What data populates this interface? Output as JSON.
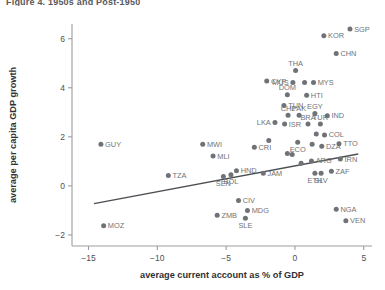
{
  "header": {
    "cropped_title": "Figure 4.  1950s and Post-1950"
  },
  "chart_data": {
    "type": "scatter",
    "title": "",
    "xlabel": "average current account as % of GDP",
    "ylabel": "average per capita GDP growth",
    "xlim": [
      -16.2,
      5.6
    ],
    "ylim": [
      -2.45,
      6.6
    ],
    "xticks": [
      -15,
      -10,
      -5,
      0,
      5
    ],
    "xticklabels": [
      "−15",
      "−10",
      "−5",
      "0",
      "5"
    ],
    "yticks": [
      -2,
      0,
      2,
      4,
      6
    ],
    "yticklabels": [
      "−2",
      "0",
      "2",
      "4",
      "6"
    ],
    "grid": false,
    "legend": "none",
    "marker_color": "#6f7276",
    "line_color": "#4b4e52",
    "trendline": {
      "label": "",
      "x": [
        -14.6,
        4.6
      ],
      "y": [
        -0.72,
        1.3
      ]
    },
    "points": [
      {
        "label": "SGP",
        "x": 4.0,
        "y": 6.4,
        "lp": "right"
      },
      {
        "label": "KOR",
        "x": 2.1,
        "y": 6.12,
        "lp": "right"
      },
      {
        "label": "CHN",
        "x": 3.0,
        "y": 5.4,
        "lp": "right"
      },
      {
        "label": "THA",
        "x": 0.05,
        "y": 4.7,
        "lp": "top"
      },
      {
        "label": "CYP",
        "x": -2.05,
        "y": 4.28,
        "lp": "right"
      },
      {
        "label": "MUS",
        "x": -0.15,
        "y": 4.22,
        "lp": "left"
      },
      {
        "label": "MYS",
        "x": 1.35,
        "y": 4.22,
        "lp": "right"
      },
      {
        "label": "",
        "x": 0.7,
        "y": 4.22,
        "lp": "none"
      },
      {
        "label": "DOM",
        "x": -0.55,
        "y": 3.72,
        "lp": "top"
      },
      {
        "label": "HTI",
        "x": 0.85,
        "y": 3.7,
        "lp": "right"
      },
      {
        "label": "TUN",
        "x": -0.8,
        "y": 3.28,
        "lp": "right"
      },
      {
        "label": "CHL",
        "x": -0.5,
        "y": 2.88,
        "lp": "top"
      },
      {
        "label": "PAK",
        "x": 0.3,
        "y": 2.88,
        "lp": "top"
      },
      {
        "label": "EGY",
        "x": 1.45,
        "y": 2.95,
        "lp": "top"
      },
      {
        "label": "IND",
        "x": 2.35,
        "y": 2.86,
        "lp": "right"
      },
      {
        "label": "LKA",
        "x": -1.45,
        "y": 2.58,
        "lp": "left"
      },
      {
        "label": "ISR",
        "x": -0.75,
        "y": 2.52,
        "lp": "right"
      },
      {
        "label": "BRA",
        "x": 0.95,
        "y": 2.52,
        "lp": "top"
      },
      {
        "label": "TUR",
        "x": 1.85,
        "y": 2.52,
        "lp": "top"
      },
      {
        "label": "COL",
        "x": 2.15,
        "y": 2.08,
        "lp": "right"
      },
      {
        "label": "",
        "x": 1.55,
        "y": 2.12,
        "lp": "none"
      },
      {
        "label": "TTO",
        "x": 3.2,
        "y": 1.72,
        "lp": "right"
      },
      {
        "label": "GUY",
        "x": -14.1,
        "y": 1.7,
        "lp": "right"
      },
      {
        "label": "MWI",
        "x": -6.7,
        "y": 1.7,
        "lp": "right"
      },
      {
        "label": "",
        "x": -1.9,
        "y": 1.85,
        "lp": "none"
      },
      {
        "label": "CRI",
        "x": -2.95,
        "y": 1.58,
        "lp": "right"
      },
      {
        "label": "ECO",
        "x": 0.2,
        "y": 1.78,
        "lp": "bottom"
      },
      {
        "label": "DZA",
        "x": 1.95,
        "y": 1.62,
        "lp": "right"
      },
      {
        "label": "",
        "x": 1.25,
        "y": 1.7,
        "lp": "none"
      },
      {
        "label": "MLI",
        "x": -5.95,
        "y": 1.22,
        "lp": "right"
      },
      {
        "label": "IRN",
        "x": 3.3,
        "y": 1.1,
        "lp": "right"
      },
      {
        "label": "",
        "x": -0.55,
        "y": 1.32,
        "lp": "none"
      },
      {
        "label": "",
        "x": -0.2,
        "y": 1.28,
        "lp": "none"
      },
      {
        "label": "ARG",
        "x": 1.2,
        "y": 1.02,
        "lp": "right"
      },
      {
        "label": "",
        "x": 0.45,
        "y": 0.92,
        "lp": "none"
      },
      {
        "label": "TZA",
        "x": -9.2,
        "y": 0.42,
        "lp": "right"
      },
      {
        "label": "HND",
        "x": -4.25,
        "y": 0.62,
        "lp": "right"
      },
      {
        "label": "JAM",
        "x": -2.3,
        "y": 0.52,
        "lp": "right"
      },
      {
        "label": "ZAF",
        "x": 2.65,
        "y": 0.6,
        "lp": "right"
      },
      {
        "label": "ETH",
        "x": 1.45,
        "y": 0.52,
        "lp": "bottom"
      },
      {
        "label": "SLV",
        "x": 1.9,
        "y": 0.52,
        "lp": "bottom"
      },
      {
        "label": "SEN",
        "x": -5.2,
        "y": 0.38,
        "lp": "bottom"
      },
      {
        "label": "BOL",
        "x": -4.65,
        "y": 0.45,
        "lp": "bottom"
      },
      {
        "label": "CIV",
        "x": -4.1,
        "y": -0.6,
        "lp": "right"
      },
      {
        "label": "NGA",
        "x": 3.0,
        "y": -0.95,
        "lp": "right"
      },
      {
        "label": "ZMB",
        "x": -5.65,
        "y": -1.2,
        "lp": "right"
      },
      {
        "label": "MDG",
        "x": -3.45,
        "y": -1.0,
        "lp": "right"
      },
      {
        "label": "SLE",
        "x": -3.6,
        "y": -1.32,
        "lp": "bottom"
      },
      {
        "label": "VEN",
        "x": 3.7,
        "y": -1.42,
        "lp": "right"
      },
      {
        "label": "MOZ",
        "x": -13.9,
        "y": -1.62,
        "lp": "right"
      }
    ]
  }
}
